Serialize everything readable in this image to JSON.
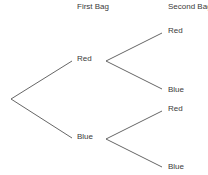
{
  "diagram": {
    "type": "probability-tree",
    "headers": {
      "first": "First Bag",
      "second": "Second Bag"
    },
    "first_level": [
      {
        "label": "Red",
        "children": [
          {
            "label": "Red"
          },
          {
            "label": "Blue"
          }
        ]
      },
      {
        "label": "Blue",
        "children": [
          {
            "label": "Red"
          },
          {
            "label": "Blue"
          }
        ]
      }
    ],
    "line_color": "#555555"
  }
}
